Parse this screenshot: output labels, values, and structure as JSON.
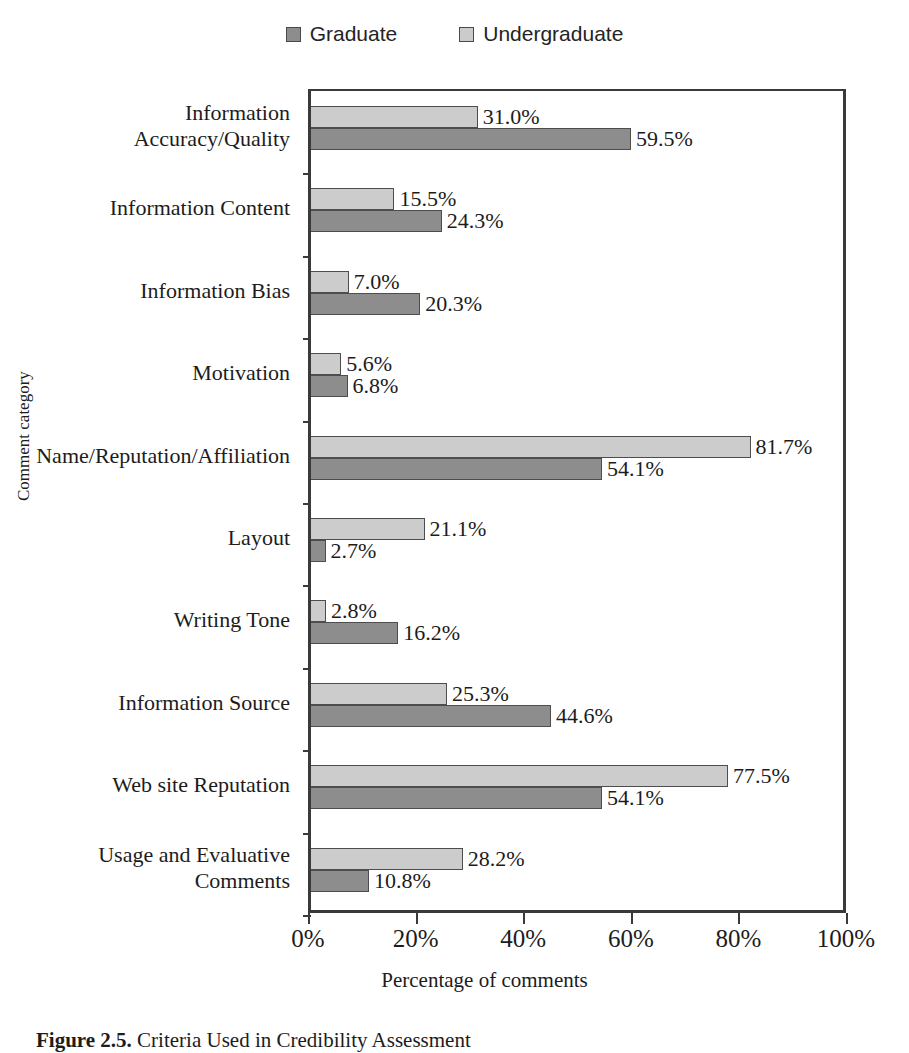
{
  "legend": {
    "items": [
      {
        "label": "Graduate",
        "color": "#8d8d8d",
        "swatch_icon": "square-swatch-icon"
      },
      {
        "label": "Undergraduate",
        "color": "#cccccc",
        "swatch_icon": "square-swatch-icon"
      }
    ]
  },
  "axes": {
    "y_title": "Comment category",
    "x_title": "Percentage of comments",
    "x_ticks": [
      "0%",
      "20%",
      "40%",
      "60%",
      "80%",
      "100%"
    ]
  },
  "caption": {
    "prefix": "Figure 2.5.",
    "text": "Criteria Used in Credibility Assessment"
  },
  "chart_data": {
    "type": "bar",
    "orientation": "horizontal",
    "title": "",
    "xlabel": "Percentage of comments",
    "ylabel": "Comment category",
    "xlim": [
      0,
      100
    ],
    "xticks": [
      0,
      20,
      40,
      60,
      80,
      100
    ],
    "grid": false,
    "legend_position": "top-center",
    "categories": [
      "Information Accuracy/Quality",
      "Information Content",
      "Information Bias",
      "Motivation",
      "Name/Reputation/Affiliation",
      "Layout",
      "Writing Tone",
      "Information Source",
      "Web site Reputation",
      "Usage and Evaluative Comments"
    ],
    "series": [
      {
        "name": "Undergraduate",
        "color": "#cccccc",
        "values": [
          31.0,
          15.5,
          7.0,
          5.6,
          81.7,
          21.1,
          2.8,
          25.3,
          77.5,
          28.2
        ],
        "labels": [
          "31.0%",
          "15.5%",
          "7.0%",
          "5.6%",
          "81.7%",
          "21.1%",
          "2.8%",
          "25.3%",
          "77.5%",
          "28.2%"
        ]
      },
      {
        "name": "Graduate",
        "color": "#8d8d8d",
        "values": [
          59.5,
          24.3,
          20.3,
          6.8,
          54.1,
          2.7,
          16.2,
          44.6,
          54.1,
          10.8
        ],
        "labels": [
          "59.5%",
          "24.3%",
          "20.3%",
          "6.8%",
          "54.1%",
          "2.7%",
          "16.2%",
          "44.6%",
          "54.1%",
          "10.8%"
        ]
      }
    ]
  },
  "category_lines": [
    [
      "Information",
      "Accuracy/Quality"
    ],
    [
      "Information Content"
    ],
    [
      "Information Bias"
    ],
    [
      "Motivation"
    ],
    [
      "Name/Reputation/Affiliation"
    ],
    [
      "Layout"
    ],
    [
      "Writing Tone"
    ],
    [
      "Information Source"
    ],
    [
      "Web site Reputation"
    ],
    [
      "Usage and Evaluative",
      "Comments"
    ]
  ]
}
